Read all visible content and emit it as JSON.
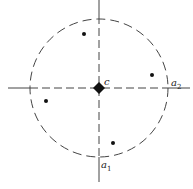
{
  "diagram": {
    "type": "scatter-with-circle",
    "center": {
      "label": "c",
      "x": 99,
      "y": 88
    },
    "circle": {
      "cx": 99,
      "cy": 88,
      "r": 69,
      "style": "dashed"
    },
    "axes": [
      {
        "name": "a1",
        "label_base": "a",
        "label_sub": "1",
        "orientation": "vertical"
      },
      {
        "name": "a2",
        "label_base": "a",
        "label_sub": "2",
        "orientation": "horizontal"
      }
    ],
    "points": [
      {
        "x": 84,
        "y": 34
      },
      {
        "x": 152,
        "y": 75
      },
      {
        "x": 46,
        "y": 101
      },
      {
        "x": 113,
        "y": 143
      }
    ],
    "colors": {
      "ink": "#222222",
      "background": "#ffffff"
    }
  }
}
